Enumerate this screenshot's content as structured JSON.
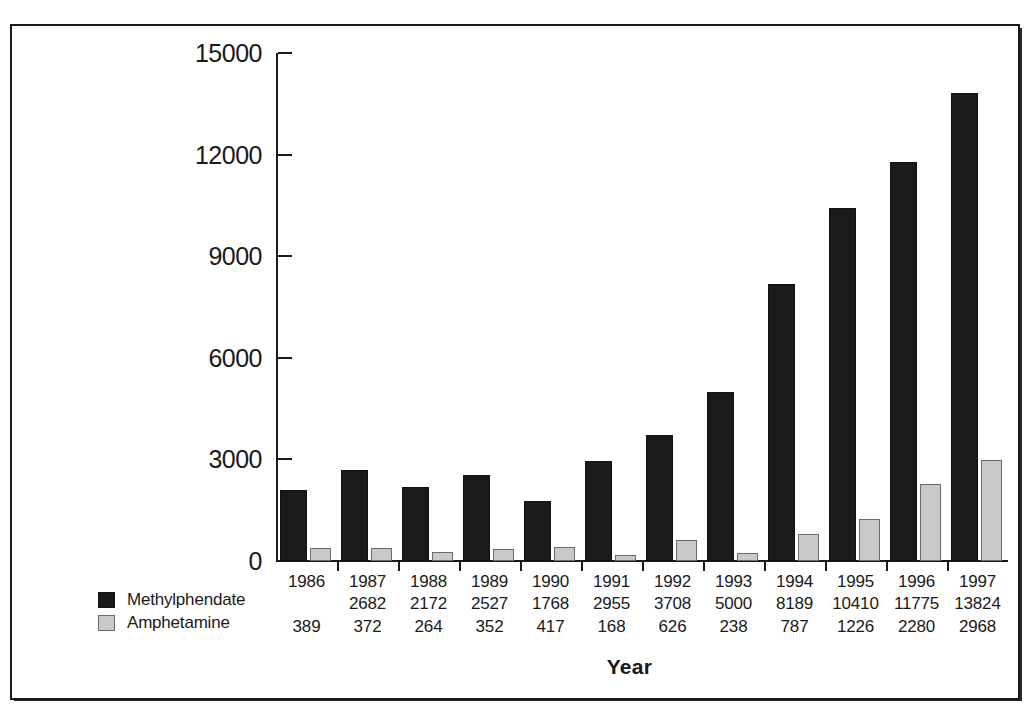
{
  "chart_data": {
    "type": "bar",
    "title": "",
    "subtitle": "",
    "xlabel": "Year",
    "ylabel": "",
    "ylim": [
      0,
      15000
    ],
    "yticks": [
      0,
      3000,
      6000,
      9000,
      12000,
      15000
    ],
    "grid": false,
    "legend_position": "bottom-left",
    "categories": [
      "1986",
      "1987",
      "1988",
      "1989",
      "1990",
      "1991",
      "1992",
      "1993",
      "1994",
      "1995",
      "1996",
      "1997"
    ],
    "series": [
      {
        "name": "Methylphendate",
        "color": "#1a1a1a",
        "values": [
          2100,
          2682,
          2172,
          2527,
          1768,
          2955,
          3708,
          5000,
          8189,
          10410,
          11775,
          13824
        ],
        "printed_labels": [
          "",
          "2682",
          "2172",
          "2527",
          "1768",
          "2955",
          "3708",
          "5000",
          "8189",
          "10410",
          "11775",
          "13824"
        ]
      },
      {
        "name": "Amphetamine",
        "color": "#c9c9c9",
        "values": [
          389,
          372,
          264,
          352,
          417,
          168,
          626,
          238,
          787,
          1226,
          2280,
          2968
        ],
        "printed_labels": [
          "389",
          "372",
          "264",
          "352",
          "417",
          "168",
          "626",
          "238",
          "787",
          "1226",
          "2280",
          "2968"
        ]
      }
    ]
  },
  "legend": {
    "items": [
      {
        "label": "Methylphendate",
        "swatch": "dark"
      },
      {
        "label": "Amphetamine",
        "swatch": "light"
      }
    ]
  },
  "axis": {
    "x_title": "Year"
  }
}
